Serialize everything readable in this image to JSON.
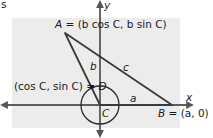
{
  "diagram": {
    "corner_fragment": "s",
    "axes": {
      "x_label": "x",
      "y_label": "y"
    },
    "points": {
      "A": {
        "name": "A",
        "coords_text": "(b cos C, b sin C)"
      },
      "B": {
        "name": "B",
        "coords_text": "(a, 0)"
      },
      "C": {
        "name": "C"
      },
      "D": {
        "name": "D",
        "coords_text": "(cos C, sin C)"
      }
    },
    "sides": {
      "a": "a",
      "b": "b",
      "c": "c"
    },
    "unit_circle": {
      "center": "C",
      "radius": 1
    },
    "colors": {
      "background_panel": "#ececec",
      "stroke": "#3a3a3a",
      "axis": "#555555"
    }
  }
}
